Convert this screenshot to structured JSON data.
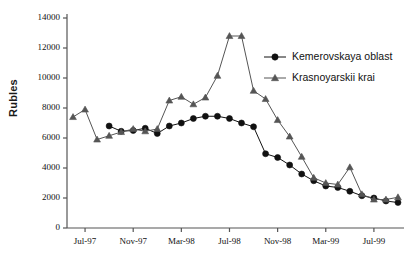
{
  "chart_data": {
    "type": "line",
    "title": "",
    "subtitle": "",
    "xlabel": "",
    "ylabel": "Rubles",
    "ylim": [
      0,
      14000
    ],
    "ytick_values": [
      0,
      2000,
      4000,
      6000,
      8000,
      10000,
      12000,
      14000
    ],
    "ytick_labels": [
      "0",
      "2000",
      "4000",
      "6000",
      "8000",
      "10000",
      "12000",
      "14000"
    ],
    "grid": false,
    "legend_position": "upper right",
    "x": [
      "Jun-97",
      "Jul-97",
      "Aug-97",
      "Sep-97",
      "Oct-97",
      "Nov-97",
      "Dec-97",
      "Jan-98",
      "Feb-98",
      "Mar-98",
      "Apr-98",
      "May-98",
      "Jun-98",
      "Jul-98",
      "Aug-98",
      "Sep-98",
      "Oct-98",
      "Nov-98",
      "Dec-98",
      "Jan-99",
      "Feb-99",
      "Mar-99",
      "Apr-99",
      "May-99",
      "Jun-99",
      "Jul-99",
      "Aug-99",
      "Sep-99"
    ],
    "xtick_labels": [
      "Jul-97",
      "Nov-97",
      "Mar-98",
      "Jul-98",
      "Nov-98",
      "Mar-99",
      "Jul-99"
    ],
    "xtick_positions": [
      "Jul-97",
      "Nov-97",
      "Mar-98",
      "Jul-98",
      "Nov-98",
      "Mar-99",
      "Jul-99"
    ],
    "series": [
      {
        "name": "Kemerovskaya oblast",
        "marker": "circle",
        "color": "#111111",
        "values": [
          null,
          null,
          null,
          6800,
          6450,
          6500,
          6650,
          6300,
          6800,
          7000,
          7300,
          7450,
          7450,
          7300,
          7000,
          6750,
          4950,
          4700,
          4200,
          3600,
          3150,
          2800,
          2700,
          2450,
          2150,
          2000,
          1800,
          1700
        ]
      },
      {
        "name": "Krasnoyarskii krai",
        "marker": "triangle",
        "color": "#555555",
        "values": [
          7400,
          7900,
          5900,
          6150,
          6400,
          6600,
          6450,
          6600,
          8500,
          8750,
          8250,
          8700,
          10150,
          12800,
          12800,
          9150,
          8600,
          7200,
          6100,
          4750,
          3350,
          3000,
          2900,
          4050,
          2250,
          1900,
          1900,
          2050
        ]
      }
    ]
  },
  "legend": {
    "items": [
      {
        "label": "Kemerovskaya oblast",
        "marker": "circle"
      },
      {
        "label": "Krasnoyarskii krai",
        "marker": "triangle"
      }
    ]
  }
}
